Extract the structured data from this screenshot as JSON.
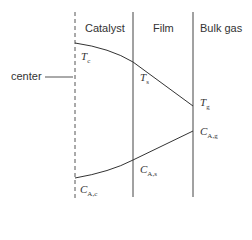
{
  "regions": {
    "catalyst": "Catalyst",
    "film": "Film",
    "bulk_gas": "Bulk gas"
  },
  "center_label": "center",
  "symbols": {
    "Tc": {
      "main": "T",
      "sub": "c"
    },
    "Ts": {
      "main": "T",
      "sub": "s"
    },
    "Tg": {
      "main": "T",
      "sub": "g"
    },
    "CAg": {
      "main": "C",
      "sub": "A,g"
    },
    "CAs": {
      "main": "C",
      "sub": "A,s"
    },
    "CAc": {
      "main": "C",
      "sub": "A,c"
    }
  },
  "colors": {
    "line": "#333333"
  }
}
